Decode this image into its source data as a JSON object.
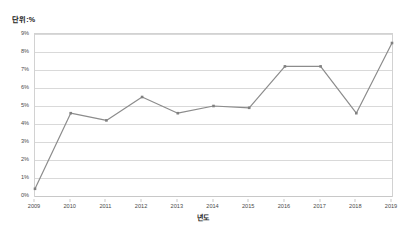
{
  "chart_data": {
    "type": "line",
    "title": "단위:%",
    "xlabel": "년도",
    "ylabel": "",
    "categories": [
      "2009",
      "2010",
      "2011",
      "2012",
      "2013",
      "2014",
      "2015",
      "2016",
      "2017",
      "2018",
      "2019"
    ],
    "values": [
      0.4,
      4.6,
      4.2,
      5.5,
      4.6,
      5.0,
      4.9,
      7.2,
      7.2,
      4.6,
      8.5
    ],
    "series": [
      {
        "name": "비율",
        "values": [
          0.4,
          4.6,
          4.2,
          5.5,
          4.6,
          5.0,
          4.9,
          7.2,
          7.2,
          4.6,
          8.5
        ]
      }
    ],
    "ylim": [
      0,
      9
    ],
    "ytick_step": 1,
    "ytick_labels": [
      "0%",
      "1%",
      "2%",
      "3%",
      "4%",
      "5%",
      "6%",
      "7%",
      "8%",
      "9%"
    ],
    "grid": true,
    "legend": false,
    "legend_position": "none",
    "marker": "square",
    "line_color": "#8c8c8c",
    "marker_color": "#808080",
    "grid_color": "#d9d9d9",
    "plot_border_color": "#d2d2d2",
    "axis_text_color": "#4a4a4a",
    "title_color": "#222222"
  },
  "icons": {
    "chart_type_icon": "line-chart-icon"
  }
}
